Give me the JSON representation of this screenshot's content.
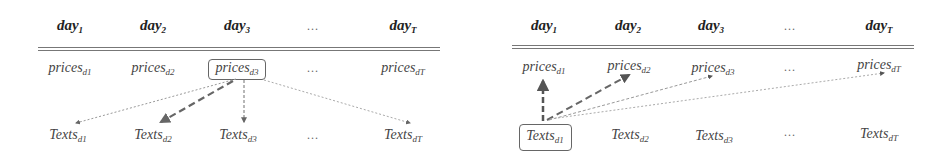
{
  "panels": [
    {
      "id": "left",
      "headers": [
        {
          "base": "day",
          "sub": "1"
        },
        {
          "base": "day",
          "sub": "2"
        },
        {
          "base": "day",
          "sub": "3"
        },
        {
          "base": "…",
          "sub": ""
        },
        {
          "base": "day",
          "sub": "T"
        }
      ],
      "prices": [
        {
          "base": "prices",
          "sub": "d1"
        },
        {
          "base": "prices",
          "sub": "d2"
        },
        {
          "base": "prices",
          "sub": "d3"
        },
        {
          "base": "…",
          "sub": ""
        },
        {
          "base": "prices",
          "sub": "dT"
        }
      ],
      "texts": [
        {
          "base": "Texts",
          "sub": "d1"
        },
        {
          "base": "Texts",
          "sub": "d2"
        },
        {
          "base": "Texts",
          "sub": "d3"
        },
        {
          "base": "…",
          "sub": ""
        },
        {
          "base": "Texts",
          "sub": "dT"
        }
      ],
      "highlighted": "prices_d3",
      "arrows": [
        {
          "from": "prices_d3",
          "to": "Texts_d1",
          "style": "thin-dotted"
        },
        {
          "from": "prices_d3",
          "to": "Texts_d2",
          "style": "thick-dashed"
        },
        {
          "from": "prices_d3",
          "to": "Texts_d3",
          "style": "medium-dashed"
        },
        {
          "from": "prices_d3",
          "to": "Texts_dT",
          "style": "thin-dotted"
        }
      ]
    },
    {
      "id": "right",
      "headers": [
        {
          "base": "day",
          "sub": "1"
        },
        {
          "base": "day",
          "sub": "2"
        },
        {
          "base": "day",
          "sub": "3"
        },
        {
          "base": "…",
          "sub": ""
        },
        {
          "base": "day",
          "sub": "T"
        }
      ],
      "prices": [
        {
          "base": "prices",
          "sub": "d1"
        },
        {
          "base": "prices",
          "sub": "d2"
        },
        {
          "base": "prices",
          "sub": "d3"
        },
        {
          "base": "…",
          "sub": ""
        },
        {
          "base": "prices",
          "sub": "dT"
        }
      ],
      "texts": [
        {
          "base": "Texts",
          "sub": "d1"
        },
        {
          "base": "Texts",
          "sub": "d2"
        },
        {
          "base": "Texts",
          "sub": "d3"
        },
        {
          "base": "…",
          "sub": ""
        },
        {
          "base": "Texts",
          "sub": "dT"
        }
      ],
      "highlighted": "Texts_d1",
      "arrows": [
        {
          "from": "Texts_d1",
          "to": "prices_d1",
          "style": "thick-dashed"
        },
        {
          "from": "Texts_d1",
          "to": "prices_d2",
          "style": "thick-dashed"
        },
        {
          "from": "Texts_d1",
          "to": "prices_d3",
          "style": "thin-dotted"
        },
        {
          "from": "Texts_d1",
          "to": "prices_dT",
          "style": "thin-dotted"
        }
      ]
    }
  ]
}
